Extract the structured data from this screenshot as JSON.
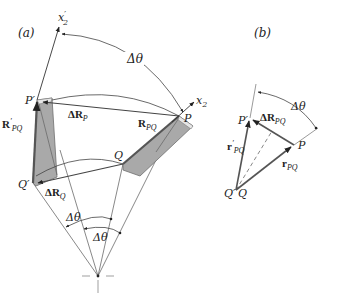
{
  "panel_a": {
    "label": "(a)",
    "axis_rotated": "x",
    "axis_rotated_sub": "2",
    "axis_rotated_prime": "′",
    "axis_original": "x",
    "axis_original_sub": "2",
    "angle_top": "Δθ",
    "angle_bottom_1": "Δθ",
    "angle_bottom_2": "Δθ",
    "point_P": "P",
    "point_P_prime": "P′",
    "point_Q": "Q",
    "point_Q_prime": "Q′",
    "vec_R_PQ_prime_main": "R",
    "vec_R_PQ_prime_sup": "′",
    "vec_R_PQ_prime_sub": "PQ",
    "vec_dR_P_main": "ΔR",
    "vec_dR_P_sub": "P",
    "vec_R_PQ_main": "R",
    "vec_R_PQ_sub": "PQ",
    "vec_dR_Q_main": "ΔR",
    "vec_dR_Q_sub": "Q"
  },
  "panel_b": {
    "label": "(b)",
    "angle": "Δθ",
    "point_P": "P",
    "point_P_prime": "P′",
    "point_Q": "Q",
    "point_Q_prime": "Q′",
    "vec_dR_PQ_main": "ΔR",
    "vec_dR_PQ_sub": "PQ",
    "vec_r_PQ_prime_main": "r",
    "vec_r_PQ_prime_sup": "′",
    "vec_r_PQ_prime_sub": "PQ",
    "vec_r_PQ_main": "r",
    "vec_r_PQ_sub": "PQ"
  },
  "colors": {
    "line": "#333333",
    "body_fill": "#a9a9a9",
    "body_edge": "#6e6e6e",
    "body_highlight": "#e6e6e6"
  }
}
